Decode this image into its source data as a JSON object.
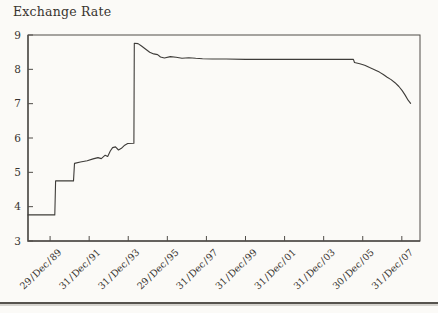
{
  "chart_data": {
    "type": "line",
    "title": "Exchange Rate",
    "xlabel": "",
    "ylabel": "",
    "grid": "off",
    "legend": "none",
    "x_tick_labels": [
      "29 / Dec / 89",
      "31 / Dec / 91",
      "31 / Dec / 93",
      "29 / Dec / 95",
      "31 / Dec / 97",
      "31 / Dec / 99",
      "31 / Dec / 01",
      "31 / Dec / 03",
      "30 / Dec / 05",
      "31 / Dec / 07"
    ],
    "x_tick_positions": [
      1990,
      1992,
      1994,
      1996,
      1998,
      2000,
      2002,
      2004,
      2006,
      2008
    ],
    "y_ticks": [
      3,
      4,
      5,
      6,
      7,
      8,
      9
    ],
    "x_range": [
      1988.87,
      2008.93
    ],
    "y_range": [
      3,
      9
    ],
    "series": [
      {
        "name": "Exchange Rate",
        "points": [
          [
            1988.87,
            3.76
          ],
          [
            1990.24,
            3.76
          ],
          [
            1990.28,
            4.75
          ],
          [
            1991.2,
            4.75
          ],
          [
            1991.25,
            5.26
          ],
          [
            1991.55,
            5.3
          ],
          [
            1991.9,
            5.34
          ],
          [
            1992.2,
            5.39
          ],
          [
            1992.45,
            5.43
          ],
          [
            1992.62,
            5.4
          ],
          [
            1992.82,
            5.5
          ],
          [
            1992.95,
            5.46
          ],
          [
            1993.08,
            5.62
          ],
          [
            1993.2,
            5.72
          ],
          [
            1993.35,
            5.74
          ],
          [
            1993.5,
            5.65
          ],
          [
            1993.65,
            5.7
          ],
          [
            1993.82,
            5.79
          ],
          [
            1993.97,
            5.84
          ],
          [
            1994.29,
            5.85
          ],
          [
            1994.31,
            8.76
          ],
          [
            1994.5,
            8.75
          ],
          [
            1994.68,
            8.68
          ],
          [
            1994.86,
            8.6
          ],
          [
            1995.1,
            8.5
          ],
          [
            1995.3,
            8.45
          ],
          [
            1995.5,
            8.43
          ],
          [
            1995.65,
            8.36
          ],
          [
            1995.85,
            8.33
          ],
          [
            1996.15,
            8.37
          ],
          [
            1996.45,
            8.35
          ],
          [
            1996.75,
            8.32
          ],
          [
            1997.1,
            8.34
          ],
          [
            1997.45,
            8.32
          ],
          [
            1997.8,
            8.31
          ],
          [
            1998.3,
            8.3
          ],
          [
            1999.0,
            8.3
          ],
          [
            2000.0,
            8.29
          ],
          [
            2001.0,
            8.29
          ],
          [
            2002.0,
            8.29
          ],
          [
            2003.0,
            8.29
          ],
          [
            2004.0,
            8.29
          ],
          [
            2005.0,
            8.29
          ],
          [
            2005.52,
            8.29
          ],
          [
            2005.58,
            8.2
          ],
          [
            2005.85,
            8.16
          ],
          [
            2006.1,
            8.12
          ],
          [
            2006.35,
            8.05
          ],
          [
            2006.6,
            7.99
          ],
          [
            2006.85,
            7.92
          ],
          [
            2007.05,
            7.85
          ],
          [
            2007.25,
            7.77
          ],
          [
            2007.45,
            7.7
          ],
          [
            2007.65,
            7.61
          ],
          [
            2007.85,
            7.5
          ],
          [
            2008.02,
            7.38
          ],
          [
            2008.18,
            7.24
          ],
          [
            2008.32,
            7.1
          ],
          [
            2008.45,
            7.01
          ]
        ]
      }
    ]
  },
  "colors": {
    "background": "#fbfaf7",
    "line": "#3e3c39",
    "axis": "#504d49",
    "text": "#38342f",
    "rule": "#56534e",
    "rule_shadow": "#ccc9c3"
  }
}
